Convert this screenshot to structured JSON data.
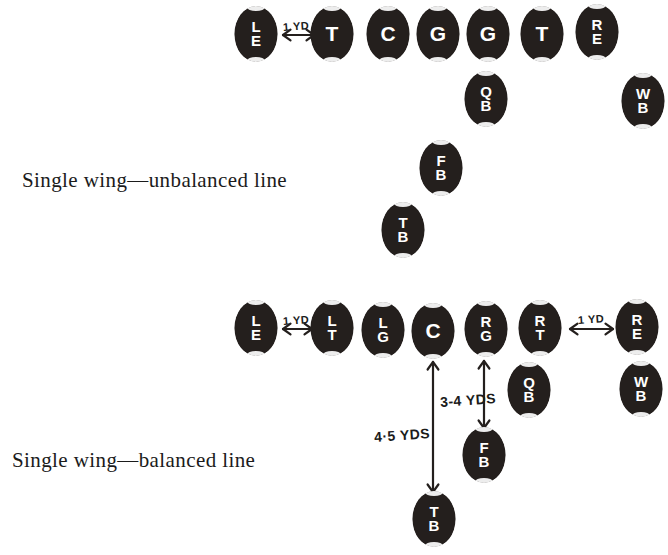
{
  "page": {
    "ink_color": "#241f1d",
    "background_color": "#ffffff",
    "marker_text_color": "#ffffff"
  },
  "formations": [
    {
      "id": "single-wing-unbalanced",
      "caption": "Single wing—unbalanced line",
      "caption_x": 22,
      "caption_y": 168,
      "players": [
        {
          "name": "left-end",
          "label": "LE",
          "stacked": true,
          "x": 256,
          "y": 34
        },
        {
          "name": "tackle-1",
          "label": "T",
          "stacked": false,
          "x": 332,
          "y": 34
        },
        {
          "name": "center",
          "label": "C",
          "stacked": false,
          "x": 388,
          "y": 34
        },
        {
          "name": "guard-1",
          "label": "G",
          "stacked": false,
          "x": 438,
          "y": 34
        },
        {
          "name": "guard-2",
          "label": "G",
          "stacked": false,
          "x": 488,
          "y": 34
        },
        {
          "name": "tackle-2",
          "label": "T",
          "stacked": false,
          "x": 542,
          "y": 34
        },
        {
          "name": "right-end",
          "label": "RE",
          "stacked": true,
          "x": 597,
          "y": 32
        },
        {
          "name": "quarterback",
          "label": "QB",
          "stacked": true,
          "x": 486,
          "y": 99
        },
        {
          "name": "wingback",
          "label": "WB",
          "stacked": true,
          "x": 643,
          "y": 101
        },
        {
          "name": "fullback",
          "label": "FB",
          "stacked": true,
          "x": 441,
          "y": 168
        },
        {
          "name": "tailback",
          "label": "TB",
          "stacked": true,
          "x": 403,
          "y": 230
        }
      ],
      "measurements": [
        {
          "name": "le-to-t-gap",
          "label": "1 YD",
          "orientation": "horizontal",
          "label_x": 283,
          "label_y": 20,
          "arrow_x1": 283,
          "arrow_y1": 35,
          "arrow_x2": 314,
          "arrow_y2": 35
        }
      ]
    },
    {
      "id": "single-wing-balanced",
      "caption": "Single wing—balanced line",
      "caption_x": 12,
      "caption_y": 448,
      "players": [
        {
          "name": "left-end",
          "label": "LE",
          "stacked": true,
          "x": 256,
          "y": 328
        },
        {
          "name": "left-tackle",
          "label": "LT",
          "stacked": true,
          "x": 332,
          "y": 328
        },
        {
          "name": "left-guard",
          "label": "LG",
          "stacked": true,
          "x": 383,
          "y": 330
        },
        {
          "name": "center",
          "label": "C",
          "stacked": false,
          "x": 433,
          "y": 331
        },
        {
          "name": "right-guard",
          "label": "RG",
          "stacked": true,
          "x": 486,
          "y": 329
        },
        {
          "name": "right-tackle",
          "label": "RT",
          "stacked": true,
          "x": 540,
          "y": 328
        },
        {
          "name": "right-end",
          "label": "RE",
          "stacked": true,
          "x": 637,
          "y": 327
        },
        {
          "name": "quarterback",
          "label": "QB",
          "stacked": true,
          "x": 529,
          "y": 390
        },
        {
          "name": "wingback",
          "label": "WB",
          "stacked": true,
          "x": 641,
          "y": 389
        },
        {
          "name": "fullback",
          "label": "FB",
          "stacked": true,
          "x": 484,
          "y": 455
        },
        {
          "name": "tailback",
          "label": "TB",
          "stacked": true,
          "x": 434,
          "y": 519
        }
      ],
      "measurements": [
        {
          "name": "le-to-lt-gap",
          "label": "1 YD",
          "orientation": "horizontal",
          "label_x": 283,
          "label_y": 314,
          "arrow_x1": 283,
          "arrow_y1": 329,
          "arrow_x2": 312,
          "arrow_y2": 329
        },
        {
          "name": "rt-to-re-gap",
          "label": "1 YD",
          "orientation": "horizontal",
          "label_x": 578,
          "label_y": 313,
          "arrow_x1": 570,
          "arrow_y1": 329,
          "arrow_x2": 613,
          "arrow_y2": 329
        },
        {
          "name": "center-to-fullback-depth",
          "label": "3-4 YDS",
          "orientation": "vertical",
          "label_x": 440,
          "label_y": 392,
          "arrow_x1": 484,
          "arrow_y1": 361,
          "arrow_x2": 484,
          "arrow_y2": 428
        },
        {
          "name": "center-to-tailback-depth",
          "label": "4·5 YDS",
          "orientation": "vertical",
          "label_x": 374,
          "label_y": 427,
          "arrow_x1": 433,
          "arrow_y1": 362,
          "arrow_x2": 433,
          "arrow_y2": 492
        }
      ]
    }
  ]
}
